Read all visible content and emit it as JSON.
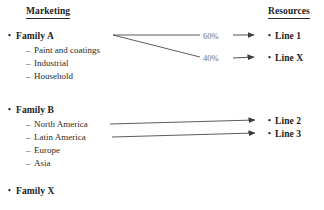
{
  "columns": {
    "left_header": "Marketing",
    "right_header": "Resources"
  },
  "marketing": [
    {
      "label": "Family A",
      "children": [
        "Paint and coatings",
        "Industrial",
        "Household"
      ]
    },
    {
      "label": "Family B",
      "children": [
        "North America",
        "Latin America",
        "Europe",
        "Asia"
      ]
    },
    {
      "label": "Family X",
      "children": []
    }
  ],
  "resources": [
    {
      "label": "Line 1"
    },
    {
      "label": "Line X"
    },
    {
      "label": "Line 2"
    },
    {
      "label": "Line 3"
    }
  ],
  "edge_labels": {
    "share_top": "60%",
    "share_bottom": "40%"
  },
  "markers": {
    "family_bullet": "•",
    "child_dash": "–",
    "resource_bullet": "•",
    "arrow": "arrow-right-icon"
  },
  "colors": {
    "text": "#1c1c1c",
    "subtext": "#2a2a2a",
    "percent": "#6d6d6d",
    "wire": "#4a4a4a",
    "background": "#ffffff"
  }
}
